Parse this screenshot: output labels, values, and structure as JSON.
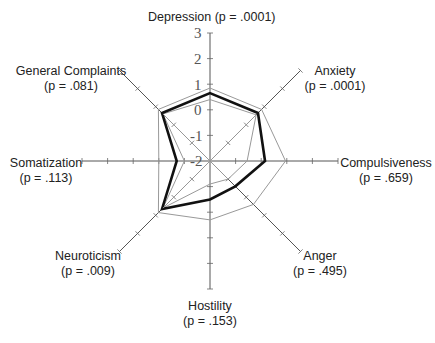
{
  "chart_data": {
    "type": "radar",
    "title": "",
    "center": [
      210,
      161
    ],
    "unit_px": 25.6,
    "scale_min": -2,
    "radial_ticks": [
      "3",
      "2",
      "1",
      "0",
      "-1",
      "-2"
    ],
    "axes": [
      {
        "name": "Depression",
        "p": ".0001",
        "angle": -90,
        "length": 128
      },
      {
        "name": "Anxiety",
        "p": ".0001",
        "angle": -45,
        "length": 128
      },
      {
        "name": "Compulsiveness",
        "p": ".659",
        "angle": 0,
        "length": 128
      },
      {
        "name": "Anger",
        "p": ".495",
        "angle": 45,
        "length": 128
      },
      {
        "name": "Hostility",
        "p": ".153",
        "angle": 90,
        "length": 128
      },
      {
        "name": "Neuroticism",
        "p": ".009",
        "angle": 135,
        "length": 128
      },
      {
        "name": "Somatization",
        "p": ".113",
        "angle": 180,
        "length": 128
      },
      {
        "name": "General Complaints",
        "p": ".081",
        "angle": -135,
        "length": 128
      }
    ],
    "series": [
      {
        "name": "outer-gray",
        "style": "thin-gray",
        "values": [
          0.85,
          0.85,
          0.95,
          0.4,
          0.3,
          0.85,
          0.0,
          0.85
        ]
      },
      {
        "name": "inner-gray",
        "style": "thin-gray",
        "values": [
          0.4,
          0.55,
          -0.55,
          -1.0,
          -1.1,
          0.6,
          -1.0,
          0.6
        ]
      },
      {
        "name": "main",
        "style": "bold-black",
        "values": [
          0.65,
          0.65,
          0.15,
          -0.6,
          -0.5,
          0.65,
          -0.7,
          0.65
        ]
      }
    ]
  },
  "labels": {
    "depression": {
      "name": "Depression",
      "p": "(p = .0001)"
    },
    "anxiety": {
      "name": "Anxiety",
      "p": "(p = .0001)"
    },
    "compulsiveness": {
      "name": "Compulsiveness",
      "p": "(p = .659)"
    },
    "anger": {
      "name": "Anger",
      "p": "(p = .495)"
    },
    "hostility": {
      "name": "Hostility",
      "p": "(p = .153)"
    },
    "neuroticism": {
      "name": "Neuroticism",
      "p": "(p = .009)"
    },
    "somatization": {
      "name": "Somatization",
      "p": "(p = .113)"
    },
    "general_complaints": {
      "name": "General Complaints",
      "p": "(p = .081)"
    },
    "depression_top": "Depression (p = .0001)"
  },
  "ticks": {
    "t3": "3",
    "t2": "2",
    "t1": "1",
    "t0": "0",
    "tm1": "-1",
    "tm2": "-2"
  }
}
